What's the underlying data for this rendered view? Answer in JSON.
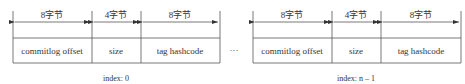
{
  "diagram": {
    "blocks": [
      {
        "index_label": "index: 0",
        "fields": [
          {
            "size_label": "8字节",
            "name": "commitlog offset"
          },
          {
            "size_label": "4字节",
            "name": "size"
          },
          {
            "size_label": "8字节",
            "name": "tag hashcode"
          }
        ]
      },
      {
        "index_label": "index: n – 1",
        "fields": [
          {
            "size_label": "8字节",
            "name": "commitlog offset"
          },
          {
            "size_label": "4字节",
            "name": "size"
          },
          {
            "size_label": "8字节",
            "name": "tag hashcode"
          }
        ]
      }
    ],
    "ellipsis": "···"
  }
}
